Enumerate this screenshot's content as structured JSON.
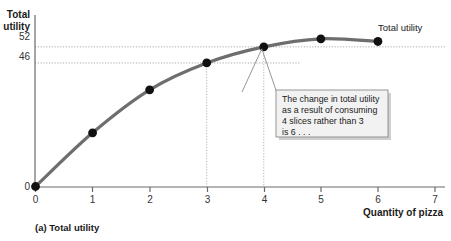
{
  "figure": {
    "caption": "(a) Total utility",
    "series_label": "Total utility"
  },
  "chart_data": {
    "type": "line",
    "title": "",
    "subtitle": "",
    "xlabel": "Quantity of pizza",
    "ylabel": "Total utility",
    "x": [
      0,
      1,
      2,
      3,
      4,
      5,
      6
    ],
    "values": [
      0,
      20,
      36,
      46,
      52,
      55,
      54
    ],
    "series": [
      {
        "name": "Total utility",
        "values": [
          0,
          20,
          36,
          46,
          52,
          55,
          54
        ]
      }
    ],
    "xticks": [
      "0",
      "1",
      "2",
      "3",
      "4",
      "5",
      "6",
      "7"
    ],
    "xtick_values": [
      0,
      1,
      2,
      3,
      4,
      5,
      6,
      7
    ],
    "yticks": [
      "0",
      "46",
      "52"
    ],
    "ytick_values": [
      0,
      46,
      52
    ],
    "xlim": [
      0,
      7
    ],
    "ylim": [
      0,
      62
    ],
    "grid": "dotted-guides-at-46-and-52",
    "legend": "inline-right-of-curve",
    "markers": true,
    "marker_color": "#111111",
    "line_color": "#6e6e6e",
    "guide_points": [
      {
        "x": 3,
        "y": 46
      },
      {
        "x": 4,
        "y": 52
      }
    ],
    "annotations": [
      {
        "text": "The change in total utility as a result of consuming 4 slices rather than 3 is 6 . . .",
        "lines": [
          "The change in total utility",
          "as a result of consuming",
          "4 slices rather than 3",
          "is 6 . . ."
        ],
        "points_to": {
          "x": 4,
          "y": 52
        }
      }
    ]
  },
  "colors": {
    "curve": "#6e6e6e",
    "marker": "#111111",
    "axis": "#5a5a5a",
    "guide": "#9a9a9a",
    "callout_fill": "#f2f2f2",
    "callout_border": "#8a8a8a",
    "callout_shadow": "#cfcfcf"
  }
}
